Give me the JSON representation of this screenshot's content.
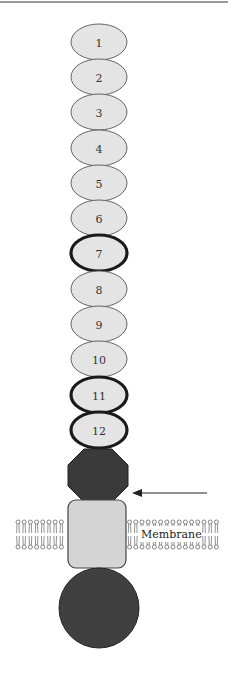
{
  "figure": {
    "domains": [
      {
        "label": "1",
        "cy": 42,
        "bold": false
      },
      {
        "label": "2",
        "cy": 77,
        "bold": false
      },
      {
        "label": "3",
        "cy": 112,
        "bold": false
      },
      {
        "label": "4",
        "cy": 148,
        "bold": false
      },
      {
        "label": "5",
        "cy": 183,
        "bold": false
      },
      {
        "label": "6",
        "cy": 218,
        "bold": false
      },
      {
        "label": "7",
        "cy": 253,
        "bold": true
      },
      {
        "label": "8",
        "cy": 289,
        "bold": false
      },
      {
        "label": "9",
        "cy": 324,
        "bold": false
      },
      {
        "label": "10",
        "cy": 359,
        "bold": false
      },
      {
        "label": "11",
        "cy": 395,
        "bold": true
      },
      {
        "label": "12",
        "cy": 430,
        "bold": true
      }
    ],
    "membrane_label": "Membrane",
    "colors": {
      "domain_fill": "#e4e4e4",
      "domain_stroke": "#555555",
      "domain_bold_stroke": "#1a1a1a",
      "octagon_fill": "#3a3a3a",
      "tm_box_fill": "#d4d4d4",
      "circle_fill": "#404040",
      "lipid": "#777777"
    }
  }
}
